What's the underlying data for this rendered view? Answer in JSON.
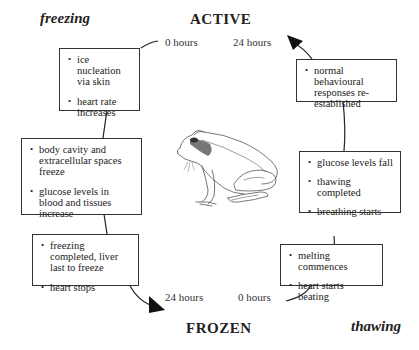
{
  "phases": {
    "freezing": "freezing",
    "thawing": "thawing"
  },
  "states": {
    "active": "ACTIVE",
    "frozen": "FROZEN"
  },
  "time_labels": {
    "top_left": "0 hours",
    "top_right": "24 hours",
    "bottom_left": "24 hours",
    "bottom_right": "0 hours"
  },
  "freezing_boxes": [
    {
      "items": [
        "ice nucleation via skin",
        "heart rate increases"
      ]
    },
    {
      "items": [
        "body cavity and extracellular spaces freeze",
        "glucose levels in blood and tissues increase"
      ]
    },
    {
      "items": [
        "freezing completed, liver last to freeze",
        "heart stops"
      ]
    }
  ],
  "thawing_boxes": [
    {
      "items": [
        "melting commences",
        "heart starts beating"
      ]
    },
    {
      "items": [
        "glucose levels fall",
        "thawing completed",
        "breathing starts"
      ]
    },
    {
      "items": [
        "normal behavioural responses re-established"
      ]
    }
  ],
  "illustration": {
    "subject": "frog"
  }
}
